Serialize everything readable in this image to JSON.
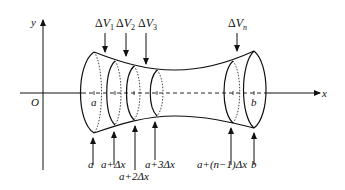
{
  "diagram": {
    "axes": {
      "x_label": "x",
      "y_label": "y",
      "origin_label": "O"
    },
    "endpoint_labels": {
      "left": "a",
      "right": "b"
    },
    "volume_labels": [
      {
        "delta": "Δ",
        "var": "V",
        "sub": "1"
      },
      {
        "delta": "Δ",
        "var": "V",
        "sub": "2"
      },
      {
        "delta": "Δ",
        "var": "V",
        "sub": "3"
      },
      {
        "delta": "Δ",
        "var": "V",
        "sub": "n"
      }
    ],
    "partition_labels": [
      "a",
      "a+Δx",
      "a+2Δx",
      "a+3Δx",
      "a+(n−1)Δx",
      "b"
    ],
    "colors": {
      "stroke": "#111111",
      "background": "#ffffff"
    }
  }
}
